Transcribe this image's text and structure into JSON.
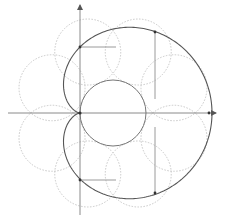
{
  "diagram": {
    "colors": {
      "background": "#ffffff",
      "axis": "#8a8a8a",
      "curve": "#555555",
      "fixed_circle": "#777777",
      "dotted_circles": "#c8c8c8",
      "construction_lines": "#9a9a9a",
      "points": "#333333"
    },
    "origin": {
      "x": 80,
      "y": 113
    },
    "axes": {
      "x_axis": {
        "x1": 8,
        "x2": 216,
        "y": 113,
        "arrow": "right"
      },
      "y_axis": {
        "x": 80,
        "y1": 215,
        "y2": 5,
        "arrow": "up"
      }
    },
    "fixed_circle": {
      "cx": 113,
      "cy": 113,
      "r": 33
    },
    "rolling_circle_radius": 33,
    "rolling_circle_count": 8,
    "cardioid": {
      "cusp_x": 80,
      "cusp_y": 113,
      "a": 66
    },
    "marked_points": [
      {
        "label": "top-left",
        "x": 80,
        "y": 47
      },
      {
        "label": "bottom-left",
        "x": 80,
        "y": 180
      },
      {
        "label": "top-right",
        "x": 155,
        "y": 32
      },
      {
        "label": "bottom-right",
        "x": 155,
        "y": 193
      },
      {
        "label": "right",
        "x": 209,
        "y": 113
      }
    ],
    "construction_lines": [
      {
        "x1": 80,
        "y1": 47,
        "x2": 116,
        "y2": 47
      },
      {
        "x1": 80,
        "y1": 180,
        "x2": 116,
        "y2": 180
      },
      {
        "x1": 155,
        "y1": 32,
        "x2": 155,
        "y2": 99
      },
      {
        "x1": 155,
        "y1": 193,
        "x2": 155,
        "y2": 127
      }
    ]
  }
}
